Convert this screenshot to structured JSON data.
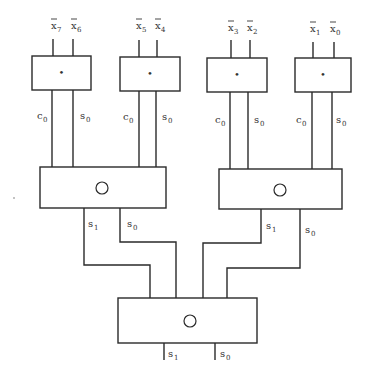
{
  "diagram": {
    "type": "tree adder / hierarchical combination network",
    "inputs": [
      {
        "base": "x",
        "sub": "7",
        "complemented": true
      },
      {
        "base": "x",
        "sub": "6",
        "complemented": true
      },
      {
        "base": "x",
        "sub": "5",
        "complemented": true
      },
      {
        "base": "x",
        "sub": "4",
        "complemented": true
      },
      {
        "base": "x",
        "sub": "3",
        "complemented": true
      },
      {
        "base": "x",
        "sub": "2",
        "complemented": true
      },
      {
        "base": "x",
        "sub": "1",
        "complemented": true
      },
      {
        "base": "x",
        "sub": "0",
        "complemented": true
      }
    ],
    "level1": {
      "operator_symbol": "•",
      "outputs": [
        {
          "base": "c",
          "sub": "0"
        },
        {
          "base": "s",
          "sub": "0"
        }
      ]
    },
    "level2": {
      "operator_symbol": "○",
      "outputs": [
        {
          "base": "s",
          "sub": "1"
        },
        {
          "base": "s",
          "sub": "0"
        }
      ]
    },
    "level3": {
      "operator_symbol": "○",
      "outputs": [
        {
          "base": "s",
          "sub": "1"
        },
        {
          "base": "s",
          "sub": "0"
        }
      ]
    },
    "colors": {
      "line": "#2a2a2a",
      "text": "#333333",
      "background": "#ffffff"
    }
  }
}
